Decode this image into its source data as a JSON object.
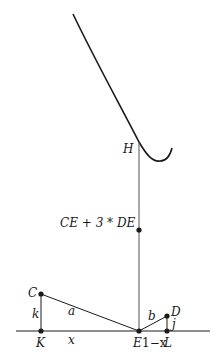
{
  "diagram": {
    "type": "geometry",
    "curve": {
      "name": "cost-curve",
      "color": "#1a1a1a"
    },
    "axis_color": "#1a1a1a",
    "vertical_line_color": "#555555",
    "points": {
      "H": "H",
      "C": "C",
      "K": "K",
      "E": "E",
      "D": "D",
      "L": "L"
    },
    "marked_point_label": "CE + 3 * DE",
    "segment_labels": {
      "k": "k",
      "a": "a",
      "x": "x",
      "b": "b",
      "j": "j",
      "one_minus_x": "1−x"
    }
  }
}
